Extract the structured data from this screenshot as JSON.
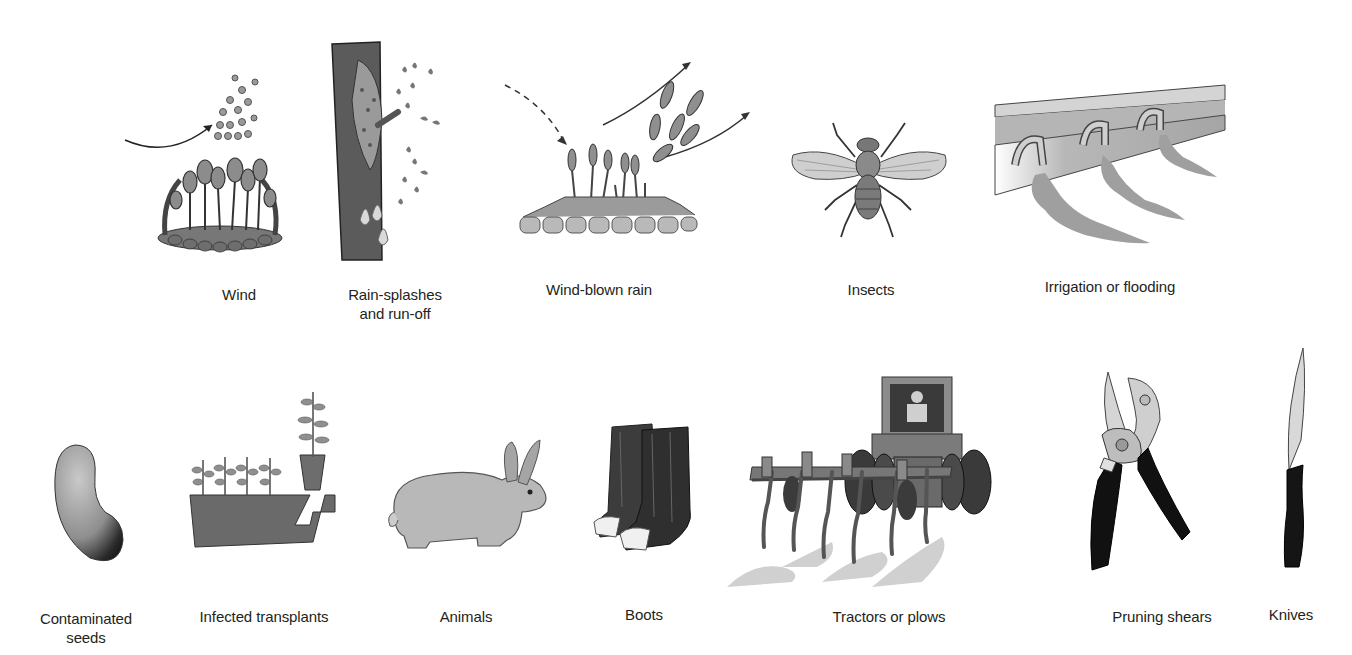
{
  "figure": {
    "rows": [
      {
        "id": "natural-agents",
        "items": [
          {
            "key": "wind",
            "label": "Wind",
            "icon": "spores-dispersed-by-wind-icon"
          },
          {
            "key": "rain_splashes",
            "label": "Rain-splashes\nand run-off",
            "label_lines": [
              "Rain-splashes",
              "and run-off"
            ],
            "icon": "rain-splash-on-stem-icon"
          },
          {
            "key": "wind_blown_rain",
            "label": "Wind-blown rain",
            "icon": "wind-blown-spores-icon"
          },
          {
            "key": "insects",
            "label": "Insects",
            "icon": "fly-icon"
          },
          {
            "key": "irrigation",
            "label": "Irrigation or flooding",
            "icon": "irrigation-pipe-icon"
          }
        ]
      },
      {
        "id": "human-and-other-agents",
        "items": [
          {
            "key": "seeds",
            "label": "Contaminated\nseeds",
            "label_lines": [
              "Contaminated",
              "seeds"
            ],
            "icon": "bean-seed-icon"
          },
          {
            "key": "transplants",
            "label": "Infected transplants",
            "icon": "seedling-tray-icon"
          },
          {
            "key": "animals",
            "label": "Animals",
            "icon": "rabbit-icon"
          },
          {
            "key": "boots",
            "label": "Boots",
            "icon": "boots-icon"
          },
          {
            "key": "tractors",
            "label": "Tractors or plows",
            "icon": "tractor-plow-icon"
          },
          {
            "key": "shears",
            "label": "Pruning shears",
            "icon": "pruning-shears-icon"
          },
          {
            "key": "knives",
            "label": "Knives",
            "icon": "knife-icon"
          }
        ]
      }
    ]
  },
  "labels": {
    "wind": "Wind",
    "rain_1": "Rain-splashes",
    "rain_2": "and run-off",
    "wind_blown_rain": "Wind-blown rain",
    "insects": "Insects",
    "irrigation": "Irrigation or flooding",
    "seeds_1": "Contaminated",
    "seeds_2": "seeds",
    "transplants": "Infected transplants",
    "animals": "Animals",
    "boots": "Boots",
    "tractors": "Tractors or plows",
    "shears": "Pruning shears",
    "knives": "Knives"
  },
  "colors": {
    "background": "#ffffff",
    "text": "#231f20",
    "illustration_dark": "#3a3a3a",
    "illustration_mid": "#8a8a8a",
    "illustration_light": "#c8c8c8"
  }
}
